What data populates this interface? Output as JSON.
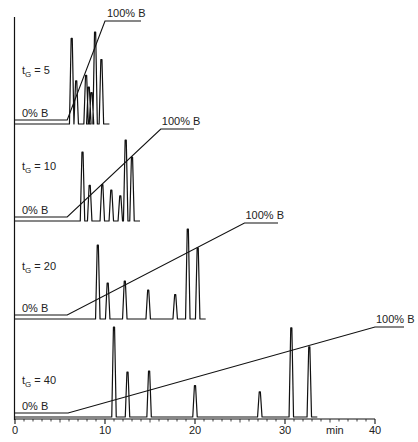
{
  "chart_data": {
    "type": "line",
    "title": "",
    "xlabel": "min",
    "ylabel": "",
    "xlim": [
      0,
      40
    ],
    "x_ticks": [
      0,
      10,
      20,
      30,
      40
    ],
    "grid": false,
    "panels": [
      {
        "label_main": "t",
        "label_sub": "G",
        "label_rest": " = 5",
        "gradient_time_min": 5,
        "gradient_start_label": "0% B",
        "gradient_end_label": "100% B",
        "gradient": {
          "start_min": 5.8,
          "end_min": 10.0
        },
        "peaks": [
          {
            "t": 6.3,
            "height": 0.93
          },
          {
            "t": 6.8,
            "height": 0.47
          },
          {
            "t": 7.9,
            "height": 0.53
          },
          {
            "t": 8.2,
            "height": 0.4
          },
          {
            "t": 8.5,
            "height": 0.34
          },
          {
            "t": 8.9,
            "height": 1.0
          },
          {
            "t": 9.6,
            "height": 0.7
          }
        ]
      },
      {
        "label_main": "t",
        "label_sub": "G",
        "label_rest": " = 10",
        "gradient_time_min": 10,
        "gradient_start_label": "0% B",
        "gradient_end_label": "100% B",
        "gradient": {
          "start_min": 5.8,
          "end_min": 16.2
        },
        "peaks": [
          {
            "t": 7.5,
            "height": 0.85
          },
          {
            "t": 8.3,
            "height": 0.44
          },
          {
            "t": 9.7,
            "height": 0.45
          },
          {
            "t": 10.7,
            "height": 0.38
          },
          {
            "t": 11.7,
            "height": 0.31
          },
          {
            "t": 12.3,
            "height": 1.0
          },
          {
            "t": 13.0,
            "height": 0.79
          }
        ]
      },
      {
        "label_main": "t",
        "label_sub": "G",
        "label_rest": " = 20",
        "gradient_time_min": 20,
        "gradient_start_label": "0% B",
        "gradient_end_label": "100% B",
        "gradient": {
          "start_min": 5.8,
          "end_min": 25.5
        },
        "peaks": [
          {
            "t": 9.2,
            "height": 0.82
          },
          {
            "t": 10.3,
            "height": 0.4
          },
          {
            "t": 12.2,
            "height": 0.42
          },
          {
            "t": 14.8,
            "height": 0.32
          },
          {
            "t": 17.8,
            "height": 0.27
          },
          {
            "t": 19.2,
            "height": 1.0
          },
          {
            "t": 20.3,
            "height": 0.79
          }
        ]
      },
      {
        "label_main": "t",
        "label_sub": "G",
        "label_rest": " = 40",
        "gradient_time_min": 40,
        "gradient_start_label": "0% B",
        "gradient_end_label": "100% B",
        "gradient": {
          "start_min": 5.9,
          "end_min": 40.0
        },
        "peaks": [
          {
            "t": 11.0,
            "height": 1.0
          },
          {
            "t": 12.5,
            "height": 0.5
          },
          {
            "t": 14.9,
            "height": 0.51
          },
          {
            "t": 20.0,
            "height": 0.35
          },
          {
            "t": 27.2,
            "height": 0.28
          },
          {
            "t": 30.7,
            "height": 0.99
          },
          {
            "t": 32.7,
            "height": 0.78
          }
        ]
      }
    ]
  },
  "axis": {
    "tick_labels": [
      "0",
      "10",
      "20",
      "30",
      "40"
    ],
    "unit_label": "min"
  },
  "colors": {
    "line": "#111111",
    "text": "#222222",
    "background": "#ffffff"
  }
}
